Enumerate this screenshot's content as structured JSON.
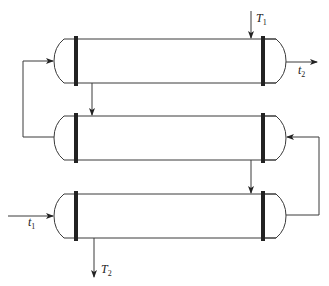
{
  "diagram": {
    "type": "shell-and-tube heat exchangers in series",
    "colors": {
      "line": "#3a3a3a",
      "tubesheet": "#222222",
      "background": "#ffffff"
    },
    "exchangers": [
      {
        "id": "exchanger-1",
        "position": "top"
      },
      {
        "id": "exchanger-2",
        "position": "middle"
      },
      {
        "id": "exchanger-3",
        "position": "bottom"
      }
    ],
    "labels": {
      "T1": {
        "main": "T",
        "sub": "1",
        "description": "shell-side hot fluid inlet"
      },
      "T2": {
        "main": "T",
        "sub": "2",
        "description": "shell-side hot fluid outlet"
      },
      "t1": {
        "main": "t",
        "sub": "1",
        "description": "tube-side cold fluid inlet"
      },
      "t2": {
        "main": "t",
        "sub": "2",
        "description": "tube-side cold fluid outlet"
      }
    }
  }
}
